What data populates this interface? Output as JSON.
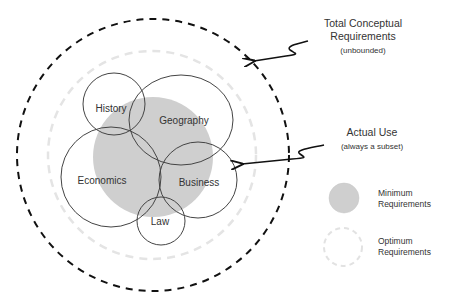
{
  "diagram": {
    "type": "nested-venn",
    "colors": {
      "outer_dashed": "#111111",
      "optimum_dashed": "#e6e6e6",
      "minimum_fill": "#cfcfcf",
      "subject_stroke": "#444444",
      "text": "#333333"
    },
    "annotations": {
      "total": {
        "line1": "Total Conceptual",
        "line2": "Requirements",
        "sub": "(unbounded)"
      },
      "actual": {
        "line1": "Actual Use",
        "sub": "(always a subset)"
      }
    },
    "subjects": [
      {
        "name": "History"
      },
      {
        "name": "Geography"
      },
      {
        "name": "Economics"
      },
      {
        "name": "Business"
      },
      {
        "name": "Law"
      }
    ],
    "legend": [
      {
        "line1": "Minimum",
        "line2": "Requirements"
      },
      {
        "line1": "Optimum",
        "line2": "Requirements"
      }
    ]
  }
}
